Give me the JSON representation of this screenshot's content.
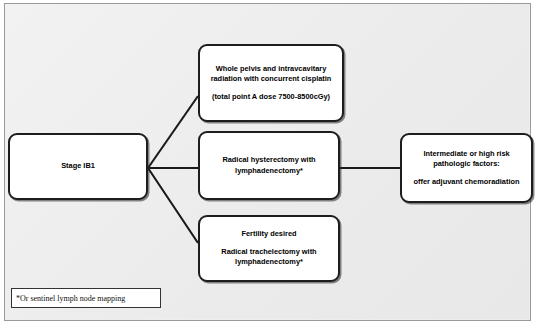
{
  "diagram": {
    "background_color": "#eeeeee",
    "border_color": "#9a9a9a",
    "node_border_color": "#1d1d1d",
    "node_fill_color": "#ffffff",
    "connector_color": "#1a1a1a",
    "nodes": {
      "stage": {
        "label": "Stage IB1",
        "lines": [
          "Stage IB1"
        ]
      },
      "radiation": {
        "label": "Whole pelvis and intravcavitary radiation with concurrent cisplatin",
        "paragraph_1": "Whole pelvis and intravcavitary radiation with concurrent cisplatin",
        "paragraph_2": "(total point A dose 7500-8500cGy)"
      },
      "hysterectomy": {
        "label": "Radical hysterectomy with lymphadenectomy*",
        "paragraph_1": "Radical hysterectomy with lymphadenectomy*"
      },
      "trachelectomy": {
        "label": "Fertility desired Radical trachelectomy with lymphadenectomy*",
        "paragraph_1": "Fertility desired",
        "paragraph_2": "Radical trachelectomy with lymphadenectomy*"
      },
      "pathology": {
        "label": "Intermediate or high risk pathologic factors: offer adjuvant chemoradiation",
        "paragraph_1": "Intermediate or high risk pathologic factors:",
        "paragraph_2": "offer adjuvant chemoradiation"
      }
    },
    "footnote": {
      "text": "*Or sentinel lymph node mapping"
    },
    "connectors": [
      {
        "name": "stage-to-radiation",
        "from": "stage",
        "to": "radiation"
      },
      {
        "name": "stage-to-hysterectomy",
        "from": "stage",
        "to": "hysterectomy"
      },
      {
        "name": "stage-to-trachelectomy",
        "from": "stage",
        "to": "trachelectomy"
      },
      {
        "name": "hysterectomy-to-pathology",
        "from": "hysterectomy",
        "to": "pathology"
      }
    ]
  }
}
